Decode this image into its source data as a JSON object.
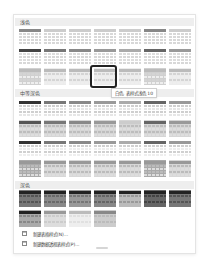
{
  "sections": [
    {
      "label": "浅色",
      "top": 3
    },
    {
      "label": "中等深色",
      "top": 74
    },
    {
      "label": "深色",
      "top": 166
    }
  ],
  "tooltip": "白色, 表样式浅色 10",
  "menu": [
    {
      "label": "新建表格样式(N)...",
      "icon": "table-style-icon"
    },
    {
      "label": "新建数据透视表样式(P)...",
      "icon": "pivot-style-icon"
    }
  ],
  "colors": {
    "highlight_border": "#222222",
    "section_bg": "#eeeeee",
    "panel_border": "#e4e4e4"
  }
}
